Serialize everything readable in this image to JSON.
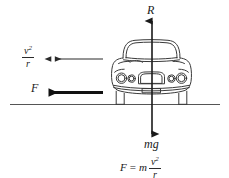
{
  "diagram": {
    "ground_line": {
      "x1": 10,
      "x2": 220,
      "y": 104,
      "color": "#555555"
    },
    "colors": {
      "ink": "#1a1a1a",
      "car_outline": "#3a3a3a",
      "ground": "#555555",
      "arrow_thin": "#2a2a2a",
      "arrow_thick": "#111111"
    },
    "forces": [
      {
        "id": "normal-reaction",
        "label": "R",
        "direction": "up",
        "style": "thin-solid",
        "label_position": {
          "x": 147,
          "y": 4
        }
      },
      {
        "id": "weight",
        "label": "mg",
        "direction": "down",
        "style": "thin-solid",
        "label_position": {
          "x": 144,
          "y": 138
        }
      },
      {
        "id": "friction-centripetal-force",
        "label": "F",
        "direction": "left",
        "style": "thick-solid",
        "label_position": {
          "x": 31,
          "y": 82
        }
      },
      {
        "id": "centripetal-acceleration",
        "label_numerator": "v",
        "label_numerator_exponent": "2",
        "label_denominator": "r",
        "direction": "left",
        "style": "thin-double-arrowhead",
        "label_position": {
          "x": 22,
          "y": 44
        }
      }
    ],
    "equation": {
      "lhs": "F",
      "operator_equals": "=",
      "mass": "m",
      "numerator": "v",
      "exponent": "2",
      "denominator": "r",
      "full_text": "F = m v²/r"
    },
    "car": {
      "name": "car-front-view",
      "parts": [
        "roof",
        "windshield",
        "body",
        "headlight-outer-left",
        "headlight-inner-left",
        "headlight-inner-right",
        "headlight-outer-right",
        "grille",
        "bumper",
        "license-plate",
        "wheel-left",
        "wheel-right"
      ]
    }
  }
}
